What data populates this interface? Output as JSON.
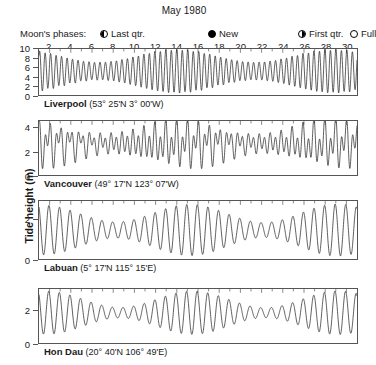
{
  "title": "May 1980",
  "axis": {
    "y_title": "Tide height (m)",
    "day_ticks": [
      2,
      4,
      6,
      8,
      10,
      12,
      14,
      16,
      18,
      20,
      22,
      24,
      26,
      28,
      30
    ],
    "day_min": 1,
    "day_max": 31
  },
  "moon": {
    "label": "Moon's phases:",
    "items": [
      {
        "name": "last-quarter",
        "label": "Last qtr.",
        "glyph": "half-left",
        "day": 8
      },
      {
        "name": "new-moon",
        "label": "New",
        "glyph": "new",
        "day": 14
      },
      {
        "name": "first-quarter",
        "label": "First qtr.",
        "glyph": "half-right",
        "day": 21
      },
      {
        "name": "full-moon",
        "label": "Full",
        "glyph": "full",
        "day": 29
      }
    ]
  },
  "chart_data": {
    "type": "line",
    "title": "May 1980",
    "xlabel": "",
    "ylabel": "Tide height (m)",
    "grid": false,
    "legend": "none",
    "xlim": [
      1,
      31
    ],
    "panels": [
      {
        "station": "Liverpool",
        "coords": "(53° 25'N 3° 00'W)",
        "classification": "(Semi-diurnal)",
        "classification_plain": "Semi-diurnal",
        "ylim": [
          0,
          10
        ],
        "yticks": [
          0,
          2,
          4,
          6,
          8,
          10
        ],
        "mean_level": 5.2,
        "semidiurnal_amplitude": 3.3,
        "diurnal_amplitude": 0.15,
        "spring_neap_modulation": 0.42,
        "spring_days": [
          14,
          29
        ],
        "neap_days": [
          8,
          21
        ],
        "cycles_per_day": 1.932,
        "peak_high_m": 9.2,
        "peak_low_m": 1.2
      },
      {
        "station": "Vancouver",
        "coords": "(49° 17'N 123° 07'W)",
        "classification": "(Mixed, predom. semi-diurnal)",
        "classification_pre": "(Mixed, ",
        "classification_em": "predom.",
        "classification_post": " semi-diurnal)",
        "ylim": [
          0,
          4.6
        ],
        "yticks": [
          0,
          2,
          4
        ],
        "mean_level": 2.7,
        "semidiurnal_amplitude": 1.0,
        "diurnal_amplitude": 0.95,
        "spring_neap_modulation": 0.35,
        "spring_days": [
          14,
          29
        ],
        "neap_days": [
          8,
          21
        ],
        "cycles_per_day": 1.932,
        "peak_high_m": 4.4,
        "peak_low_m": 0.6
      },
      {
        "station": "Labuan",
        "coords": "(5° 17'N 115° 15'E)",
        "classification": "(Mixed, predom. diurnal)",
        "classification_pre": "(Mixed, ",
        "classification_em": "predom.",
        "classification_post": " diurnal)",
        "ylim": [
          0,
          2.9
        ],
        "yticks": [
          0,
          2
        ],
        "mean_level": 1.45,
        "semidiurnal_amplitude": 0.3,
        "diurnal_amplitude": 0.78,
        "spring_neap_modulation": 0.45,
        "spring_days": [
          14,
          29
        ],
        "neap_days": [
          8,
          21
        ],
        "cycles_per_day": 1.0,
        "peak_high_m": 2.6,
        "peak_low_m": 0.35
      },
      {
        "station": "Hon Dau",
        "coords": "(20° 40'N 106° 49'E)",
        "classification": "(Diurnal)",
        "classification_plain": "Diurnal",
        "ylim": [
          0,
          3.3
        ],
        "yticks": [
          0,
          2
        ],
        "mean_level": 1.85,
        "semidiurnal_amplitude": 0.07,
        "diurnal_amplitude": 1.05,
        "spring_neap_modulation": 0.72,
        "spring_days": [
          14,
          29
        ],
        "neap_days": [
          8,
          21
        ],
        "cycles_per_day": 1.0,
        "peak_high_m": 3.1,
        "peak_low_m": 0.45
      }
    ]
  }
}
